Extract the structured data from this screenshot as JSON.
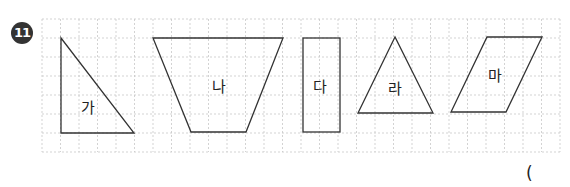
{
  "problem": {
    "number": "11",
    "answer_paren": "("
  },
  "shapes": [
    {
      "label": "가",
      "type": "right-triangle"
    },
    {
      "label": "나",
      "type": "trapezoid"
    },
    {
      "label": "다",
      "type": "rectangle"
    },
    {
      "label": "라",
      "type": "isosceles-triangle"
    },
    {
      "label": "마",
      "type": "parallelogram"
    }
  ]
}
